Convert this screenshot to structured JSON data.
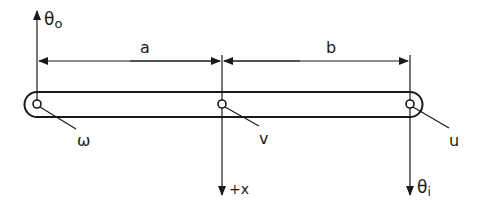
{
  "diagram": {
    "type": "lever-linkage",
    "labels": {
      "theta_o": "θ",
      "theta_o_sub": "o",
      "a": "a",
      "b": "b",
      "omega": "ω",
      "v": "v",
      "u": "u",
      "plus_x": "+x",
      "theta_i": "θ",
      "theta_i_sub": "i"
    },
    "colors": {
      "ink": "#1a1a1a",
      "background": "#ffffff"
    }
  }
}
